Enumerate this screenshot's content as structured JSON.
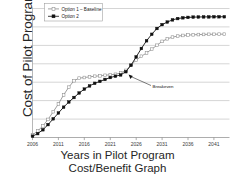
{
  "figure": {
    "y_axis_title": "Cost of  Pilot Program",
    "y_axis_subtitle": "Cumulative Costs",
    "title_line1": "Years in Pilot Program",
    "title_line2": "Cost/Benefit Graph"
  },
  "chart_data": {
    "type": "line",
    "title": "Cost/Benefit Graph",
    "xlabel": "Years in Pilot Program",
    "ylabel": "Cost of Pilot Program",
    "ylabel_sub": "Cumulative Costs",
    "grid": "horizontal",
    "legend_position": "top-left",
    "xlim": [
      2006,
      2044
    ],
    "ylim": [
      0,
      1
    ],
    "xticks": [
      "2006",
      "2011",
      "2016",
      "2021",
      "2026",
      "2031",
      "2036",
      "2041"
    ],
    "xtick_values": [
      2006,
      2011,
      2016,
      2021,
      2026,
      2031,
      2036,
      2041
    ],
    "yticks": [],
    "gridline_count": 7,
    "annotations": [
      {
        "label": "Breakeven",
        "x": 2024.5,
        "y": 0.49
      }
    ],
    "series": [
      {
        "name": "Option 1 – Baseline",
        "marker": "open-square",
        "color": "#8c8c8c",
        "x": [
          2006,
          2007,
          2008,
          2009,
          2010,
          2011,
          2012,
          2013,
          2014,
          2015,
          2016,
          2017,
          2018,
          2019,
          2020,
          2021,
          2022,
          2023,
          2024,
          2025,
          2026,
          2027,
          2028,
          2029,
          2030,
          2031,
          2032,
          2033,
          2034,
          2035,
          2036,
          2037,
          2038,
          2039,
          2040,
          2041,
          2042,
          2043
        ],
        "values": [
          0.02,
          0.05,
          0.09,
          0.14,
          0.2,
          0.26,
          0.33,
          0.39,
          0.44,
          0.46,
          0.465,
          0.47,
          0.475,
          0.478,
          0.482,
          0.487,
          0.49,
          0.5,
          0.52,
          0.56,
          0.6,
          0.63,
          0.655,
          0.685,
          0.715,
          0.745,
          0.765,
          0.778,
          0.786,
          0.791,
          0.794,
          0.796,
          0.798,
          0.799,
          0.8,
          0.8,
          0.801,
          0.801
        ]
      },
      {
        "name": "Option 2",
        "marker": "filled-square",
        "color": "#111111",
        "x": [
          2006,
          2007,
          2008,
          2009,
          2010,
          2011,
          2012,
          2013,
          2014,
          2015,
          2016,
          2017,
          2018,
          2019,
          2020,
          2021,
          2022,
          2023,
          2024,
          2025,
          2026,
          2027,
          2028,
          2029,
          2030,
          2031,
          2032,
          2033,
          2034,
          2035,
          2036,
          2037,
          2038,
          2039,
          2040,
          2041,
          2042,
          2043
        ],
        "values": [
          0.01,
          0.03,
          0.06,
          0.1,
          0.145,
          0.19,
          0.235,
          0.275,
          0.31,
          0.345,
          0.375,
          0.4,
          0.42,
          0.435,
          0.45,
          0.465,
          0.475,
          0.485,
          0.51,
          0.56,
          0.625,
          0.69,
          0.75,
          0.8,
          0.845,
          0.875,
          0.895,
          0.912,
          0.922,
          0.928,
          0.931,
          0.933,
          0.934,
          0.935,
          0.935,
          0.936,
          0.936,
          0.936
        ]
      }
    ]
  }
}
